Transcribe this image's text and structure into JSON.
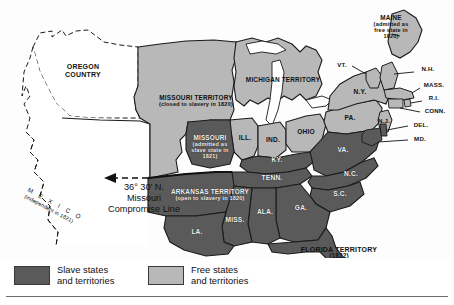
{
  "map": {
    "title": "The Missouri Compromise of 1820",
    "colors": {
      "slave_fill": "#5a5a5a",
      "free_fill": "#b8b8b8",
      "unorganized_fill": "#ffffff",
      "outline": "#1a1a1a",
      "background": "#fdfdfd"
    },
    "annotations": {
      "compromise_line": {
        "degrees": "36°  30′ N.",
        "line2": "Missouri",
        "line3": "Compromise Line",
        "arrow": "left-arrow"
      },
      "mexico": {
        "name": "M  E  X  I  C  O",
        "note": "(independent in 1821)"
      }
    },
    "territories": [
      {
        "name": "OREGON\nCOUNTRY",
        "status": "unorganized",
        "note": ""
      },
      {
        "name": "MISSOURI TERRITORY",
        "status": "free",
        "note": "(closed to slavery in 1820)"
      },
      {
        "name": "MICHIGAN TERRITORY",
        "status": "free",
        "note": ""
      },
      {
        "name": "ARKANSAS TERRITORY",
        "status": "slave",
        "note": "(open to slavery in 1820)"
      },
      {
        "name": "FLORIDA TERRITORY",
        "status": "slave",
        "note": "(1822)"
      }
    ],
    "states": [
      {
        "abbr": "MAINE",
        "status": "free",
        "note": "(admitted as\nfree state in\n1820)"
      },
      {
        "abbr": "MISSOURI",
        "status": "slave",
        "note": "(admitted as\nslave state in\n1821)"
      },
      {
        "abbr": "VT.",
        "status": "free",
        "note": ""
      },
      {
        "abbr": "N.H.",
        "status": "free",
        "note": ""
      },
      {
        "abbr": "MASS.",
        "status": "free",
        "note": ""
      },
      {
        "abbr": "R.I.",
        "status": "free",
        "note": ""
      },
      {
        "abbr": "CONN.",
        "status": "free",
        "note": ""
      },
      {
        "abbr": "N.Y.",
        "status": "free",
        "note": ""
      },
      {
        "abbr": "PA.",
        "status": "free",
        "note": ""
      },
      {
        "abbr": "N.J.",
        "status": "free",
        "note": ""
      },
      {
        "abbr": "DEL.",
        "status": "slave",
        "note": ""
      },
      {
        "abbr": "MD.",
        "status": "slave",
        "note": ""
      },
      {
        "abbr": "ILL.",
        "status": "free",
        "note": ""
      },
      {
        "abbr": "IND.",
        "status": "free",
        "note": ""
      },
      {
        "abbr": "OHIO",
        "status": "free",
        "note": ""
      },
      {
        "abbr": "VA.",
        "status": "slave",
        "note": ""
      },
      {
        "abbr": "KY.",
        "status": "slave",
        "note": ""
      },
      {
        "abbr": "TENN.",
        "status": "slave",
        "note": ""
      },
      {
        "abbr": "N.C.",
        "status": "slave",
        "note": ""
      },
      {
        "abbr": "S.C.",
        "status": "slave",
        "note": ""
      },
      {
        "abbr": "GA.",
        "status": "slave",
        "note": ""
      },
      {
        "abbr": "ALA.",
        "status": "slave",
        "note": ""
      },
      {
        "abbr": "MISS.",
        "status": "slave",
        "note": ""
      },
      {
        "abbr": "LA.",
        "status": "slave",
        "note": ""
      }
    ],
    "legend": {
      "slave": {
        "label": "Slave states\nand territories",
        "color": "#5a5a5a"
      },
      "free": {
        "label": "Free states\nand territories",
        "color": "#b8b8b8"
      }
    }
  }
}
